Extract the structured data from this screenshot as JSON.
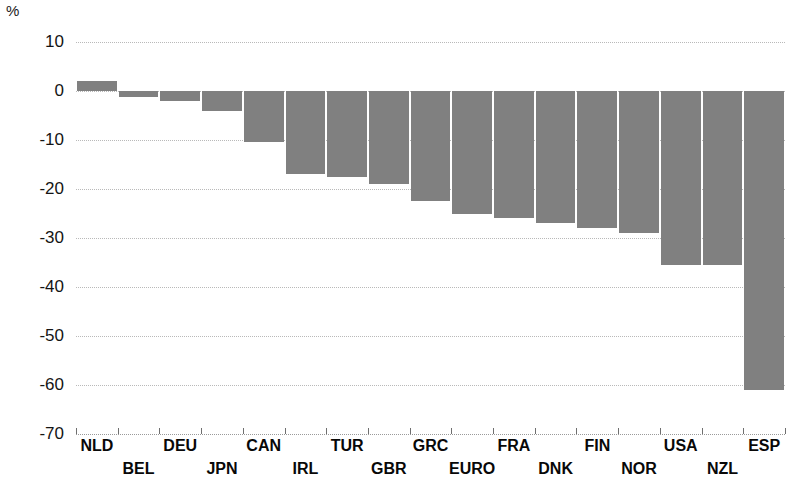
{
  "chart": {
    "unit_label": "%",
    "y_axis": {
      "ticks": [
        "10",
        "0",
        "-10",
        "-20",
        "-30",
        "-40",
        "-50",
        "-60",
        "-70"
      ],
      "min": -70,
      "max": 10,
      "step": 10
    }
  },
  "chart_data": {
    "type": "bar",
    "title": "",
    "xlabel": "",
    "ylabel": "%",
    "ylim": [
      -70,
      10
    ],
    "grid": true,
    "legend": "none",
    "orientation": "vertical",
    "bar_color": "#808080",
    "categories": [
      "NLD",
      "BEL",
      "DEU",
      "JPN",
      "CAN",
      "IRL",
      "TUR",
      "GBR",
      "GRC",
      "EURO",
      "FRA",
      "DNK",
      "FIN",
      "NOR",
      "USA",
      "NZL",
      "ESP"
    ],
    "values": [
      2.0,
      -1.2,
      -2.0,
      -4.0,
      -10.5,
      -17.0,
      -17.5,
      -19.0,
      -22.5,
      -25.0,
      -26.0,
      -27.0,
      -28.0,
      -29.0,
      -35.5,
      -35.5,
      -61.0
    ],
    "tick_labels": {
      "x_top_row": [
        "NLD",
        "DEU",
        "CAN",
        "TUR",
        "GRC",
        "FRA",
        "FIN",
        "USA",
        "ESP"
      ],
      "x_bottom_row": [
        "BEL",
        "JPN",
        "IRL",
        "GBR",
        "EURO",
        "DNK",
        "NOR",
        "NZL"
      ],
      "y": [
        "10",
        "0",
        "-10",
        "-20",
        "-30",
        "-40",
        "-50",
        "-60",
        "-70"
      ]
    }
  }
}
